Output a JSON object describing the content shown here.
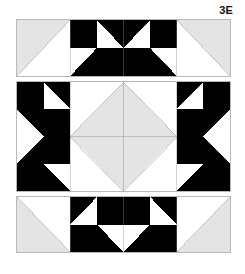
{
  "figure": {
    "label": "3E",
    "colors": {
      "black": "#000000",
      "white": "#ffffff",
      "gray": "#e4e4e4",
      "outline": "#b9b9b9",
      "seam": "#9a9a9a",
      "text": "#111111",
      "background": "#ffffff"
    },
    "panels": [
      {
        "name": "top-border-strip",
        "columns": 8,
        "rows": 2,
        "description": "Pieced border strip: gray half-square-triangle corner at each end, central four-patch star section in black and white."
      },
      {
        "name": "center-medallion-row",
        "columns": 8,
        "rows": 4,
        "description": "Central row: black and white pieced side blocks flanking a large gray square-on-point diamond split into four triangles."
      },
      {
        "name": "bottom-border-strip",
        "columns": 8,
        "rows": 2,
        "description": "Pieced border strip mirrored vertically from the top strip."
      }
    ]
  }
}
